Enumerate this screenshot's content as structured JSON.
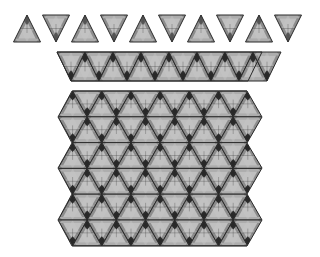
{
  "diagram": {
    "colors": {
      "background": "#ffffff",
      "edge": "#2a2a2a",
      "base_fill": "#8c8c8c",
      "light_facet": "#c8c8c8",
      "mid_facet": "#a6a6a6",
      "dark_facet": "#555555",
      "darkest_facet": "#1e1e1e"
    },
    "sections": [
      {
        "name": "separate-tiles-row",
        "tile_count": 10,
        "orientation": "alternating-up-down"
      },
      {
        "name": "joined-strip",
        "tile_count": 15,
        "rows": 1
      },
      {
        "name": "tessellated-block",
        "rows": 6
      }
    ]
  }
}
